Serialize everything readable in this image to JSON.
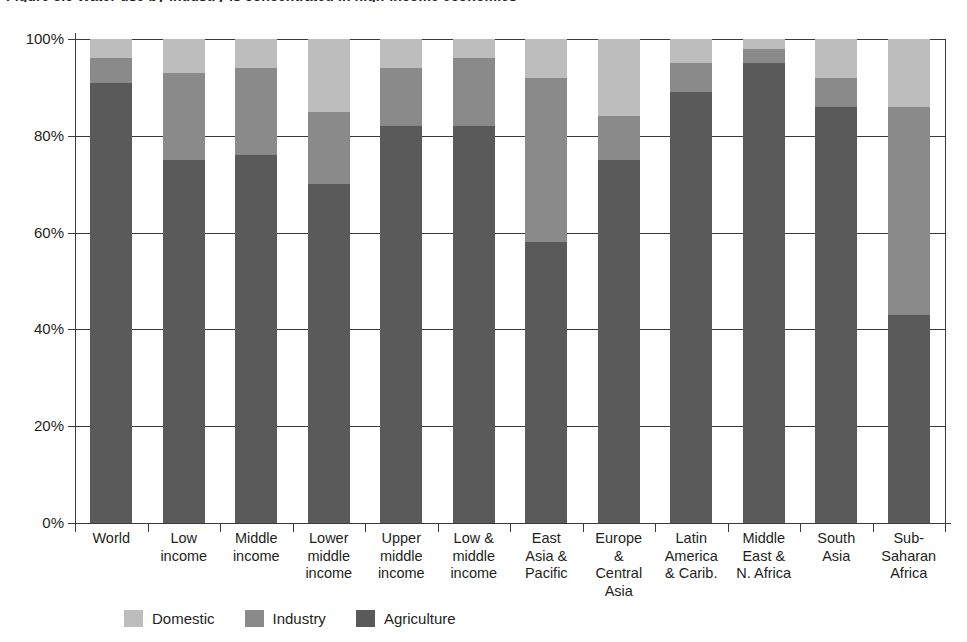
{
  "title": "Figure 3.5  Water use by industry is concentrated in high-income economies",
  "legend": {
    "items": [
      {
        "label": "Domestic",
        "color": "#bdbdbd",
        "key": "domestic"
      },
      {
        "label": "Industry",
        "color": "#8a8a8a",
        "key": "industry"
      },
      {
        "label": "Agriculture",
        "color": "#5a5a5a",
        "key": "agriculture"
      }
    ]
  },
  "axes": {
    "y_ticks": [
      "0%",
      "20%",
      "40%",
      "60%",
      "80%",
      "100%"
    ],
    "y_tick_values": [
      0,
      20,
      40,
      60,
      80,
      100
    ]
  },
  "chart_data": {
    "type": "bar",
    "stacked": true,
    "orientation": "vertical",
    "title": "Figure 3.5  Water use by industry is concentrated in high-income economies",
    "xlabel": "",
    "ylabel": "",
    "ylim": [
      0,
      100
    ],
    "yticks": [
      0,
      20,
      40,
      60,
      80,
      100
    ],
    "ytick_labels": [
      "0%",
      "20%",
      "40%",
      "60%",
      "80%",
      "100%"
    ],
    "grid": true,
    "legend_position": "bottom",
    "categories": [
      "World",
      "Low\nincome",
      "Middle\nincome",
      "Lower\nmiddle\nincome",
      "Upper\nmiddle\nincome",
      "Low &\nmiddle\nincome",
      "East\nAsia &\nPacific",
      "Europe\n&\nCentral\nAsia",
      "Latin\nAmerica\n& Carib.",
      "Middle\nEast &\nN. Africa",
      "South\nAsia",
      "Sub-\nSaharan\nAfrica"
    ],
    "series": [
      {
        "name": "Agriculture",
        "color": "#5a5a5a",
        "values": [
          91,
          75,
          76,
          70,
          82,
          82,
          58,
          75,
          89,
          95,
          86,
          43
        ]
      },
      {
        "name": "Industry",
        "color": "#8a8a8a",
        "values": [
          5,
          18,
          18,
          15,
          12,
          14,
          34,
          9,
          6,
          3,
          6,
          43
        ]
      },
      {
        "name": "Domestic",
        "color": "#bdbdbd",
        "values": [
          4,
          7,
          6,
          15,
          6,
          4,
          8,
          16,
          5,
          2,
          8,
          14
        ]
      }
    ]
  }
}
